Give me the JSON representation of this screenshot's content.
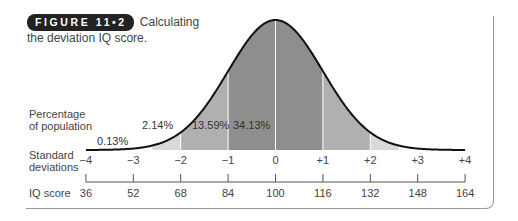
{
  "caption": {
    "badge": "FIGURE 11•2",
    "text_line1": "Calculating",
    "text_line2": "the deviation IQ score."
  },
  "row_labels": {
    "percentage_line1": "Percentage",
    "percentage_line2": "of population",
    "sd_line1": "Standard",
    "sd_line2": "deviations",
    "iq": "IQ score"
  },
  "colors": {
    "tail": "#d9d9d9",
    "mid": "#b0b0b0",
    "center": "#8e8e8e",
    "curve": "#111111",
    "divider": "#ffffff"
  },
  "chart_data": {
    "type": "area",
    "title": "Calculating the deviation IQ score.",
    "xlabel": "Standard deviations / IQ score",
    "ylabel": "Percentage of population",
    "x": [
      -4,
      -3,
      -2,
      -1,
      0,
      1,
      2,
      3,
      4
    ],
    "sd_tick_labels": [
      "−4",
      "−3",
      "−2",
      "−1",
      "0",
      "+1",
      "+2",
      "+3",
      "+4"
    ],
    "iq_tick_labels": [
      "36",
      "52",
      "68",
      "84",
      "100",
      "116",
      "132",
      "148",
      "164"
    ],
    "regions": [
      {
        "from_sd": -4,
        "to_sd": -3,
        "percent": "0.13%"
      },
      {
        "from_sd": -3,
        "to_sd": -2,
        "percent": "2.14%"
      },
      {
        "from_sd": -2,
        "to_sd": -1,
        "percent": "13.59%"
      },
      {
        "from_sd": -1,
        "to_sd": 0,
        "percent": "34.13%"
      }
    ],
    "distribution": "normal",
    "mean_iq": 100,
    "sd_iq": 16,
    "grid": false,
    "legend": "none"
  }
}
